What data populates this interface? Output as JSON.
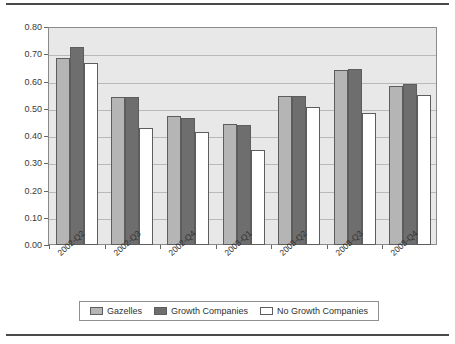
{
  "chart_data": {
    "type": "bar",
    "title": "",
    "subtitle": "",
    "xlabel": "",
    "ylabel": "",
    "categories": [
      "2002-Q2",
      "2002-Q3",
      "2002-Q4",
      "2003-Q1",
      "2003-Q2",
      "2003-Q3",
      "2003-Q4"
    ],
    "series": [
      {
        "name": "Gazelles",
        "color": "#b5b5b5",
        "values": [
          0.69,
          0.545,
          0.475,
          0.446,
          0.551,
          0.645,
          0.588
        ]
      },
      {
        "name": "Growth Companies",
        "color": "#6e6e6e",
        "values": [
          0.73,
          0.547,
          0.469,
          0.443,
          0.548,
          0.65,
          0.592
        ]
      },
      {
        "name": "No Growth Companies",
        "color": "#ffffff",
        "values": [
          0.67,
          0.433,
          0.416,
          0.349,
          0.51,
          0.486,
          0.552
        ]
      }
    ],
    "ylim": [
      0.0,
      0.8
    ],
    "ytick_labels": [
      "0.80",
      "0.70",
      "0.60",
      "0.50",
      "0.40",
      "0.30",
      "0.20",
      "0.10",
      "0.00"
    ],
    "ytick_values": [
      0.8,
      0.7,
      0.6,
      0.5,
      0.4,
      0.3,
      0.2,
      0.1,
      0.0
    ],
    "grid": true,
    "legend_position": "bottom",
    "plot_background": "#e8e8e8"
  }
}
